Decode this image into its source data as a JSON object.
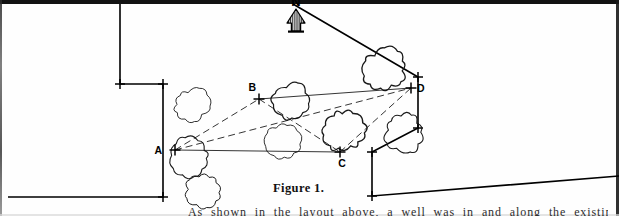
{
  "figure": {
    "caption": "Figure 1.",
    "north_label": "N",
    "north_icon": "north-arrow-icon"
  },
  "survey": {
    "station_labels": [
      "A",
      "B",
      "C",
      "D"
    ],
    "stations": [
      {
        "id": "A",
        "label": "A",
        "x": 175,
        "y": 150,
        "label_dx": -13,
        "label_dy": 4
      },
      {
        "id": "B",
        "label": "B",
        "x": 259,
        "y": 99,
        "label_dx": -3,
        "label_dy": -8
      },
      {
        "id": "C",
        "label": "C",
        "x": 340,
        "y": 152,
        "label_dx": 2,
        "label_dy": 15
      },
      {
        "id": "D",
        "label": "D",
        "x": 411,
        "y": 88,
        "label_dx": 6,
        "label_dy": 4
      }
    ],
    "lines": [
      {
        "from": "A",
        "to": "B",
        "style": "dashed"
      },
      {
        "from": "A",
        "to": "C",
        "style": "solid"
      },
      {
        "from": "A",
        "to": "D",
        "style": "dashed"
      },
      {
        "from": "B",
        "to": "D",
        "style": "solid"
      },
      {
        "from": "B",
        "to": "C",
        "style": "dashed"
      },
      {
        "from": "C",
        "to": "D",
        "style": "dashed"
      }
    ],
    "boundary_markers": 7,
    "ink_color": "#000000"
  },
  "vegetation": {
    "symbol": "bush-symbol",
    "count": 8,
    "bushes": [
      {
        "cx": 192,
        "cy": 105,
        "r": 16,
        "seed": 1,
        "weight": 0.9
      },
      {
        "cx": 190,
        "cy": 158,
        "r": 19,
        "seed": 2,
        "weight": 1.1
      },
      {
        "cx": 292,
        "cy": 101,
        "r": 18,
        "seed": 3,
        "weight": 1.2
      },
      {
        "cx": 283,
        "cy": 142,
        "r": 17,
        "seed": 4,
        "weight": 0.9
      },
      {
        "cx": 344,
        "cy": 131,
        "r": 19,
        "seed": 5,
        "weight": 1.3
      },
      {
        "cx": 386,
        "cy": 70,
        "r": 20,
        "seed": 6,
        "weight": 1.3
      },
      {
        "cx": 404,
        "cy": 132,
        "r": 19,
        "seed": 7,
        "weight": 1.1
      },
      {
        "cx": 203,
        "cy": 190,
        "r": 17,
        "seed": 8,
        "weight": 1.0
      }
    ]
  },
  "boundary": {
    "left_path": "M 120 4 L 120 84 L 163 84 L 163 197 L 8 197",
    "right_path": "M 293 4 L 418 77 L 418 128 L 372 152 L 372 196 L 619 176",
    "markers": [
      {
        "x": 120,
        "y": 84,
        "angle": 0
      },
      {
        "x": 163,
        "y": 84,
        "angle": 0
      },
      {
        "x": 163,
        "y": 197,
        "angle": 0
      },
      {
        "x": 418,
        "y": 77,
        "angle": 0
      },
      {
        "x": 418,
        "y": 128,
        "angle": 0
      },
      {
        "x": 372,
        "y": 152,
        "angle": 0
      },
      {
        "x": 372,
        "y": 196,
        "angle": 0
      }
    ]
  },
  "body": {
    "clipped_line": "As shown in the layout above, a well was in and along the existing property"
  }
}
